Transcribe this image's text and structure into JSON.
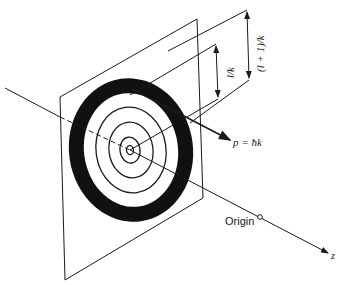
{
  "diagram": {
    "type": "physics-illustration",
    "labels": {
      "momentum": "p = ħk",
      "inner_radius": "l/k",
      "outer_radius": "(l + 1)/k",
      "origin": "Origin",
      "axis": "z"
    },
    "elements": {
      "plane": "transverse plane",
      "rings": [
        "innermost ring",
        "ring 2",
        "ring 3",
        "ring 4"
      ],
      "highlighted_annulus": "black annulus between l/k and (l+1)/k",
      "vector": "momentum arrow",
      "axis": "z axis through origin"
    },
    "colors": {
      "ink": "#1a1a1a",
      "background": "#ffffff"
    }
  }
}
